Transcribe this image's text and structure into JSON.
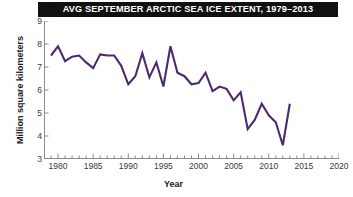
{
  "chart_data": {
    "type": "line",
    "title": "AVG SEPTEMBER ARCTIC SEA ICE EXTENT, 1979–2013",
    "xlabel": "Year",
    "ylabel": "Million square kilometers",
    "xlim": [
      1978,
      2020
    ],
    "ylim": [
      3,
      9
    ],
    "xticks": [
      1980,
      1985,
      1990,
      1995,
      2000,
      2005,
      2010,
      2015,
      2020
    ],
    "xtick_labels": [
      "1980",
      "1985",
      "1990",
      "1995",
      "2000",
      "2005",
      "2010",
      "2015",
      "2020"
    ],
    "yticks": [
      3,
      4,
      5,
      6,
      7,
      8,
      9
    ],
    "ytick_labels": [
      "3",
      "4",
      "5",
      "6",
      "7",
      "8",
      "9"
    ],
    "minor_xtick_interval": 1,
    "grid": false,
    "legend": false,
    "line_color": "#4c2a6e",
    "x": [
      1979,
      1980,
      1981,
      1982,
      1983,
      1984,
      1985,
      1986,
      1987,
      1988,
      1989,
      1990,
      1991,
      1992,
      1993,
      1994,
      1995,
      1996,
      1997,
      1998,
      1999,
      2000,
      2001,
      2002,
      2003,
      2004,
      2005,
      2006,
      2007,
      2008,
      2009,
      2010,
      2011,
      2012,
      2013
    ],
    "values": [
      7.5,
      7.9,
      7.25,
      7.45,
      7.5,
      7.2,
      6.95,
      7.55,
      7.5,
      7.5,
      7.05,
      6.25,
      6.6,
      7.6,
      6.55,
      7.2,
      6.15,
      7.9,
      6.75,
      6.6,
      6.25,
      6.3,
      6.75,
      5.95,
      6.15,
      6.05,
      5.55,
      5.9,
      4.3,
      4.7,
      5.4,
      4.9,
      4.6,
      3.6,
      5.4
    ],
    "series_name": "September Arctic sea ice extent"
  }
}
